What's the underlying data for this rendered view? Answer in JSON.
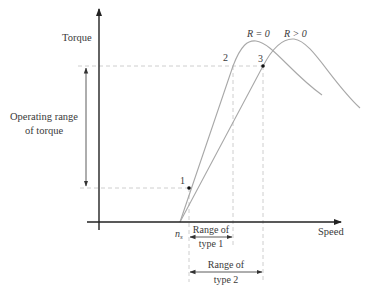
{
  "diagram": {
    "axes": {
      "y_label": "Torque",
      "x_label": "Speed",
      "origin_label_main": "n",
      "origin_label_sub": "s"
    },
    "curves": [
      {
        "name": "R = 0",
        "label": "R = 0",
        "color": "#a8a8a8"
      },
      {
        "name": "R > 0",
        "label": "R > 0",
        "color": "#a8a8a8"
      }
    ],
    "points": [
      {
        "id": "1",
        "label": "1"
      },
      {
        "id": "2",
        "label": "2"
      },
      {
        "id": "3",
        "label": "3"
      }
    ],
    "annotations": {
      "operating_range_line1": "Operating range",
      "operating_range_line2": "of torque",
      "range_type1_line1": "Range of",
      "range_type1_line2": "type 1",
      "range_type2_line1": "Range of",
      "range_type2_line2": "type 2"
    },
    "colors": {
      "axis": "#222222",
      "curve": "#a8a8a8",
      "guide": "#c8c8c8",
      "text": "#3a3a3a"
    }
  }
}
